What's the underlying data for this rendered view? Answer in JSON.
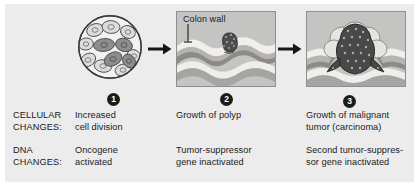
{
  "figure": {
    "background_color": "#ececec",
    "page_color": "#ffffff"
  },
  "stages": [
    {
      "number": "1",
      "illustration": "cell-cluster-with-dividing-cells",
      "cellular_change": "Increased\ncell division",
      "dna_change": "Oncogene\nactivated"
    },
    {
      "number": "2",
      "illustration": "colon-wall-with-polyp",
      "panel_label": "Colon wall",
      "cellular_change": "Growth of polyp",
      "dna_change": "Tumor-suppressor\ngene inactivated"
    },
    {
      "number": "3",
      "illustration": "colon-wall-with-malignant-tumor",
      "cellular_change": "Growth of malignant\ntumor (carcinoma)",
      "dna_change": "Second tumor-suppres-\nsor gene inactivated"
    }
  ],
  "row_labels": {
    "cellular": "CELLULAR\nCHANGES:",
    "dna": "DNA\nCHANGES:"
  },
  "arrows": {
    "arrow_1": "arrow-right-icon",
    "arrow_2": "arrow-right-icon"
  },
  "colors": {
    "badge_fill": "#1b1b1b",
    "badge_text": "#ffffff",
    "text": "#1a1a1a",
    "panel_border": "#8f8f8f",
    "tissue_light": "#e8e6e2",
    "tissue_mid": "#b9b7b3",
    "tissue_dark": "#8d8b87",
    "tumor_dark": "#4a4a4a",
    "cell_light": "#d9d9d9",
    "cell_dark": "#8d8d8d"
  }
}
